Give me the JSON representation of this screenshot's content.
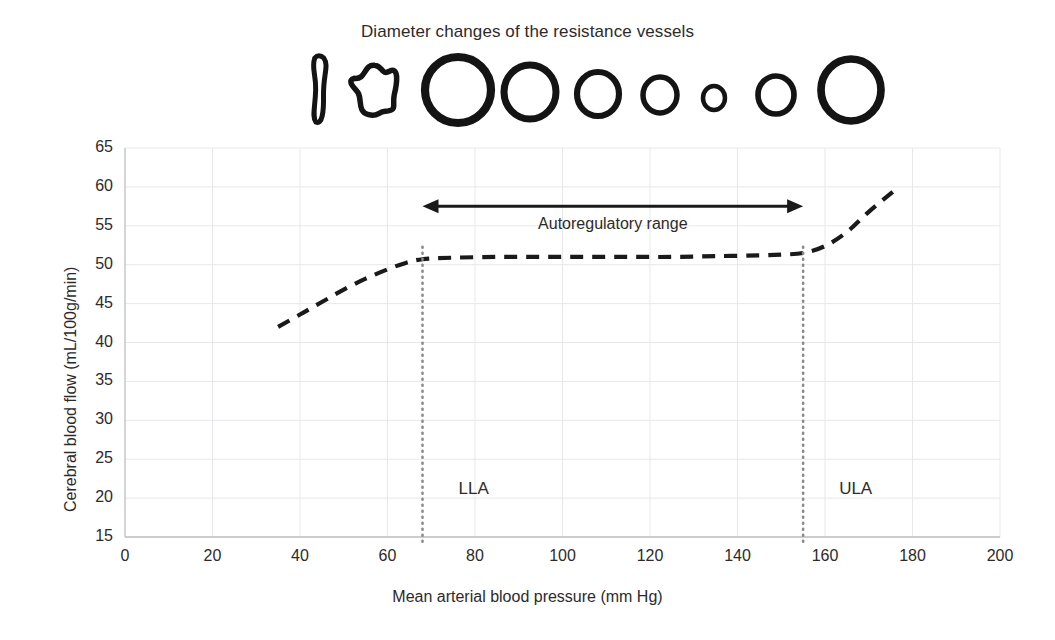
{
  "figure": {
    "vessel_panel_title": "Diameter changes of the resistance vessels",
    "vessels": [
      {
        "name": "collapsed-slit-vessel",
        "shape": "slit",
        "cx": 320,
        "cy": 90,
        "rx": 7,
        "ry": 32
      },
      {
        "name": "irregular-crenated-vessel",
        "shape": "blob",
        "cx": 377,
        "cy": 90,
        "rx": 24,
        "ry": 26
      },
      {
        "name": "vessel-circle-1",
        "shape": "circle",
        "cx": 458,
        "cy": 90,
        "rx": 33,
        "ry": 33
      },
      {
        "name": "vessel-circle-2",
        "shape": "circle",
        "cx": 530,
        "cy": 92,
        "rx": 26,
        "ry": 27
      },
      {
        "name": "vessel-circle-3",
        "shape": "circle",
        "cx": 598,
        "cy": 94,
        "rx": 21,
        "ry": 22
      },
      {
        "name": "vessel-circle-4",
        "shape": "circle",
        "cx": 660,
        "cy": 95,
        "rx": 17,
        "ry": 18
      },
      {
        "name": "vessel-circle-5",
        "shape": "circle",
        "cx": 714,
        "cy": 98,
        "rx": 11,
        "ry": 12
      },
      {
        "name": "vessel-circle-6",
        "shape": "circle",
        "cx": 776,
        "cy": 95,
        "rx": 18,
        "ry": 19
      },
      {
        "name": "vessel-circle-7",
        "shape": "circle",
        "cx": 851,
        "cy": 90,
        "rx": 30,
        "ry": 31
      }
    ]
  },
  "chart_data": {
    "type": "line",
    "title": "",
    "xlabel": "Mean arterial blood pressure (mm Hg)",
    "ylabel": "Cerebral blood flow (mL/100g/min)",
    "xlim": [
      0,
      200
    ],
    "ylim": [
      15,
      65
    ],
    "xticks": [
      0,
      20,
      40,
      60,
      80,
      100,
      120,
      140,
      160,
      180,
      200
    ],
    "yticks": [
      15,
      20,
      25,
      30,
      35,
      40,
      45,
      50,
      55,
      60,
      65
    ],
    "grid": true,
    "grid_color": "#e8e8ea",
    "legend": "none",
    "line_style": "dashed",
    "line_color": "#1a1a1a",
    "series": [
      {
        "name": "Cerebral blood flow",
        "x": [
          35,
          40,
          45,
          50,
          55,
          60,
          64,
          68,
          75,
          85,
          95,
          105,
          115,
          125,
          135,
          145,
          150,
          155,
          160,
          165,
          170,
          176
        ],
        "y": [
          42.0,
          43.6,
          45.2,
          46.8,
          48.2,
          49.4,
          50.2,
          50.7,
          50.9,
          51.0,
          51.0,
          51.0,
          51.0,
          51.0,
          51.1,
          51.2,
          51.3,
          51.5,
          52.4,
          54.2,
          56.8,
          59.6
        ]
      }
    ],
    "annotations": [
      {
        "name": "autoregulatory-range-arrow",
        "label": "Autoregulatory range",
        "x_start": 68,
        "x_end": 155,
        "y": 57.5,
        "style": "double-headed-arrow"
      },
      {
        "name": "lower-limit-marker",
        "label": "LLA",
        "x": 68,
        "style": "vertical-dotted-line",
        "label_y": 21
      },
      {
        "name": "upper-limit-marker",
        "label": "ULA",
        "x": 155,
        "style": "vertical-dotted-line",
        "label_y": 21
      }
    ]
  }
}
